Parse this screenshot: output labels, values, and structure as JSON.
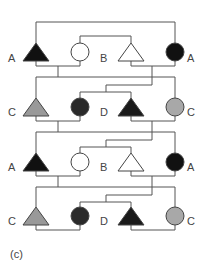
{
  "figure": {
    "caption": "(c)",
    "type": "pedigree-like mating diagram",
    "line_color": "#555555",
    "generations": [
      {
        "index": 1,
        "individuals": [
          {
            "id": "g1-a-left",
            "shape": "triangle",
            "fill": "#111111",
            "label": "A",
            "label_side": "left"
          },
          {
            "id": "g1-open-circle",
            "shape": "circle",
            "fill": "#ffffff",
            "label": ""
          },
          {
            "id": "g1-b-triangle",
            "shape": "triangle",
            "fill": "#ffffff",
            "label": "B",
            "label_side": "left"
          },
          {
            "id": "g1-a-right",
            "shape": "circle",
            "fill": "#111111",
            "label": "A",
            "label_side": "right"
          }
        ]
      },
      {
        "index": 2,
        "individuals": [
          {
            "id": "g2-c-left",
            "shape": "triangle",
            "fill": "#999999",
            "label": "C",
            "label_side": "left"
          },
          {
            "id": "g2-dark-circle",
            "shape": "circle",
            "fill": "#2a2a2a",
            "label": ""
          },
          {
            "id": "g2-d-triangle",
            "shape": "triangle",
            "fill": "#1a1a1a",
            "label": "D",
            "label_side": "left"
          },
          {
            "id": "g2-c-right",
            "shape": "circle",
            "fill": "#a8a8a8",
            "label": "C",
            "label_side": "right"
          }
        ]
      },
      {
        "index": 3,
        "individuals": [
          {
            "id": "g3-a-left",
            "shape": "triangle",
            "fill": "#111111",
            "label": "A",
            "label_side": "left"
          },
          {
            "id": "g3-open-circle",
            "shape": "circle",
            "fill": "#ffffff",
            "label": ""
          },
          {
            "id": "g3-b-triangle",
            "shape": "triangle",
            "fill": "#ffffff",
            "label": "B",
            "label_side": "left"
          },
          {
            "id": "g3-a-right",
            "shape": "circle",
            "fill": "#111111",
            "label": "A",
            "label_side": "right"
          }
        ]
      },
      {
        "index": 4,
        "individuals": [
          {
            "id": "g4-c-left",
            "shape": "triangle",
            "fill": "#999999",
            "label": "C",
            "label_side": "left"
          },
          {
            "id": "g4-dark-circle",
            "shape": "circle",
            "fill": "#2a2a2a",
            "label": ""
          },
          {
            "id": "g4-d-triangle",
            "shape": "triangle",
            "fill": "#1a1a1a",
            "label": "D",
            "label_side": "left"
          },
          {
            "id": "g4-c-right",
            "shape": "circle",
            "fill": "#a8a8a8",
            "label": "C",
            "label_side": "right"
          }
        ]
      }
    ]
  },
  "labels": {
    "g1_a_left": "A",
    "g1_b": "B",
    "g1_a_right": "A",
    "g2_c_left": "C",
    "g2_d": "D",
    "g2_c_right": "C",
    "g3_a_left": "A",
    "g3_b": "B",
    "g3_a_right": "A",
    "g4_c_left": "C",
    "g4_d": "D",
    "g4_c_right": "C"
  }
}
